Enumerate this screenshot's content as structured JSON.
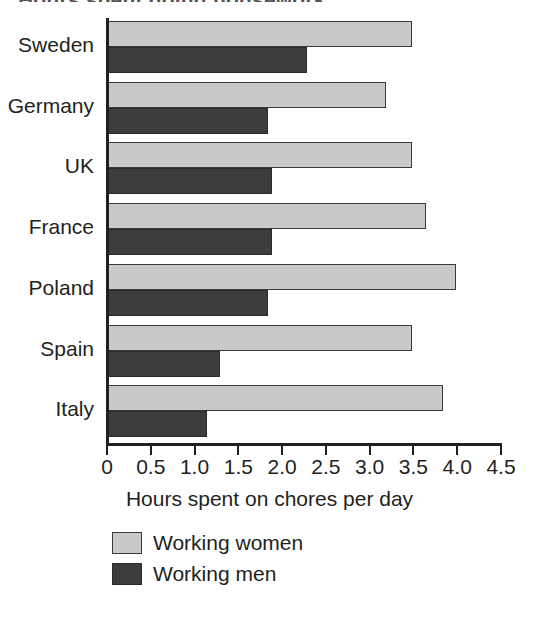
{
  "figure": {
    "title_remnant": "Hours spent doing housework",
    "axis_title": "Hours spent on chores per day"
  },
  "legend": {
    "position": "bottom-left",
    "items": [
      {
        "label": "Working women",
        "color": "#c9c9c9",
        "key": "women"
      },
      {
        "label": "Working men",
        "color": "#3d3d3d",
        "key": "men"
      }
    ]
  },
  "axis": {
    "ticks": [
      "0",
      "0.5",
      "1.0",
      "1.5",
      "2.0",
      "2.5",
      "3.0",
      "3.5",
      "4.0",
      "4.5"
    ],
    "tick_values": [
      0,
      0.5,
      1.0,
      1.5,
      2.0,
      2.5,
      3.0,
      3.5,
      4.0,
      4.5
    ]
  },
  "chart_data": {
    "type": "bar",
    "orientation": "horizontal",
    "title": "",
    "xlabel": "Hours spent on chores per day",
    "ylabel": "",
    "xlim": [
      0,
      4.5
    ],
    "grid": false,
    "legend_position": "bottom-left",
    "categories": [
      "Sweden",
      "Germany",
      "UK",
      "France",
      "Poland",
      "Spain",
      "Italy"
    ],
    "series": [
      {
        "name": "Working women",
        "color": "#c9c9c9",
        "values": [
          3.5,
          3.2,
          3.5,
          3.65,
          4.0,
          3.5,
          3.85
        ]
      },
      {
        "name": "Working men",
        "color": "#3d3d3d",
        "values": [
          2.3,
          1.85,
          1.9,
          1.9,
          1.85,
          1.3,
          1.15
        ]
      }
    ]
  }
}
